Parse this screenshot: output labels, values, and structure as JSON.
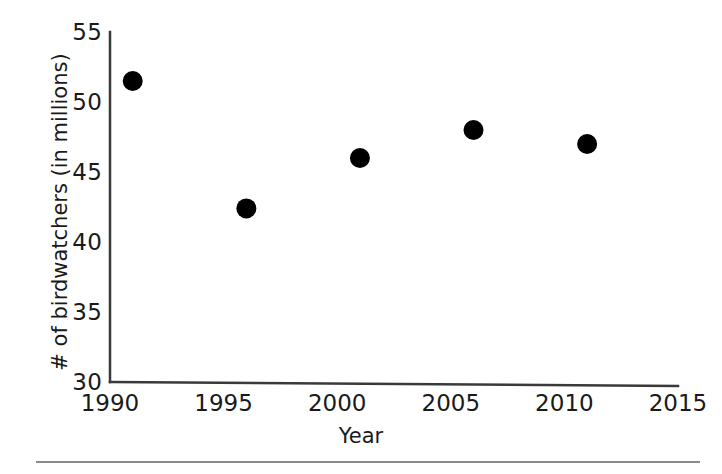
{
  "chart_data": {
    "type": "scatter",
    "title": "",
    "xlabel": "Year",
    "ylabel": "# of birdwatchers (in millions)",
    "xlim": [
      1990,
      2015
    ],
    "ylim": [
      30,
      55
    ],
    "xticks": [
      1990,
      1995,
      2000,
      2005,
      2010,
      2015
    ],
    "yticks": [
      30,
      35,
      40,
      45,
      50,
      55
    ],
    "grid": false,
    "legend": null,
    "marker": {
      "shape": "circle",
      "color": "#000000",
      "size_px": 20
    },
    "x": [
      1991,
      1996,
      2001,
      2006,
      2011
    ],
    "y": [
      51.5,
      42.4,
      46.0,
      48.0,
      47.0
    ],
    "points": [
      {
        "x": 1991,
        "y": 51.5
      },
      {
        "x": 1996,
        "y": 42.4
      },
      {
        "x": 2001,
        "y": 46.0
      },
      {
        "x": 2006,
        "y": 48.0
      },
      {
        "x": 2011,
        "y": 47.0
      }
    ]
  },
  "axes": {
    "line_color": "#3a3a3a",
    "background": "#ffffff"
  },
  "footer": {
    "rule_color": "#8a8a8a"
  }
}
